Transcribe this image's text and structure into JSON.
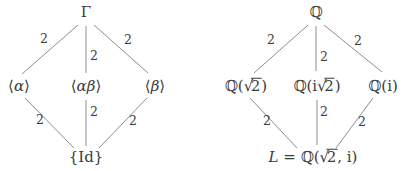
{
  "symbols": {
    "radical": "√"
  },
  "colors": {
    "text": "#3b3b3b",
    "line": "#8d8d8d",
    "background": "#ffffff"
  },
  "left_diagram": {
    "top": "Γ",
    "mid_left": {
      "bra": "⟨",
      "var": "α",
      "ket": "⟩"
    },
    "mid_center": {
      "bra": "⟨",
      "var": "αβ",
      "ket": "⟩"
    },
    "mid_right": {
      "bra": "⟨",
      "var": "β",
      "ket": "⟩"
    },
    "bottom": "{Id}",
    "edge_labels": {
      "top_left": "2",
      "top_center": "2",
      "top_right": "2",
      "bottom_left": "2",
      "bottom_center": "2",
      "bottom_right": "2"
    }
  },
  "right_diagram": {
    "top": "ℚ",
    "mid_left": {
      "pre": "ℚ(",
      "radicand": "2",
      "post": ")"
    },
    "mid_center": {
      "pre": "ℚ(i",
      "radicand": "2",
      "post": ")"
    },
    "mid_right": "ℚ(i)",
    "bottom": {
      "var": "L",
      "eq": " = ℚ(",
      "radicand": "2",
      "post": ", i)"
    },
    "edge_labels": {
      "top_left": "2",
      "top_center": "2",
      "top_right": "2",
      "bottom_left": "2",
      "bottom_center": "2",
      "bottom_right": "2"
    }
  }
}
